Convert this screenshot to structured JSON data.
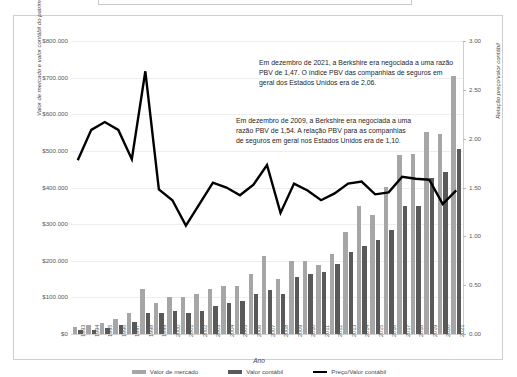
{
  "chart_data": {
    "type": "bar",
    "title": "",
    "xlabel": "Ano",
    "ylabel": "Valor de mercado e valor contábil do patrimônio (milhares de US$)",
    "ylabel_right": "Relação preço/valor contábil",
    "categories": [
      "1993",
      "1994",
      "1995",
      "1996",
      "1997",
      "1998",
      "1999",
      "2000",
      "2001",
      "2002",
      "2003",
      "2004",
      "2005",
      "2006",
      "2007",
      "2008",
      "2009",
      "2010",
      "2011",
      "2012",
      "2013",
      "2014",
      "2015",
      "2016",
      "2017",
      "2018",
      "2019",
      "2020",
      "2021"
    ],
    "ylim": [
      0,
      800000
    ],
    "ylim_right": [
      0,
      3.0
    ],
    "yticks": [
      "$0",
      "$100.000",
      "$200.000",
      "$300.000",
      "$400.000",
      "$500.000",
      "$600.000",
      "$700.000",
      "$800.000"
    ],
    "yticks_right": [
      "0.00",
      "0.50",
      "1.00",
      "1.50",
      "2.00",
      "2.50",
      "3.00"
    ],
    "grid": true,
    "legend_position": "bottom",
    "series": [
      {
        "name": "Valor de mercado",
        "type": "bar",
        "color": "#a6a6a6",
        "axis": "left",
        "values": [
          19800,
          23300,
          29600,
          42200,
          57600,
          122200,
          85600,
          101400,
          102200,
          109700,
          122100,
          130600,
          131200,
          163200,
          214000,
          149500,
          198000,
          200400,
          187600,
          219000,
          277500,
          350300,
          325400,
          401800,
          489100,
          492000,
          552500,
          545000,
          703800
        ]
      },
      {
        "name": "Valor contábil",
        "type": "bar",
        "color": "#595959",
        "axis": "left",
        "values": [
          10200,
          11900,
          17200,
          23400,
          31500,
          57400,
          57800,
          61700,
          57900,
          64000,
          77600,
          85900,
          91500,
          108400,
          120700,
          109300,
          156800,
          164900,
          168900,
          191600,
          224500,
          240200,
          255600,
          283000,
          348300,
          348700,
          424800,
          443200,
          506200
        ]
      },
      {
        "name": "Preço/Valor contábil",
        "type": "line",
        "color": "#000000",
        "axis": "right",
        "values": [
          1.78,
          2.09,
          2.17,
          2.09,
          1.79,
          2.69,
          1.48,
          1.37,
          1.11,
          1.33,
          1.55,
          1.5,
          1.42,
          1.53,
          1.73,
          1.24,
          1.54,
          1.47,
          1.37,
          1.44,
          1.54,
          1.56,
          1.43,
          1.45,
          1.61,
          1.59,
          1.58,
          1.33,
          1.47
        ]
      }
    ]
  },
  "annotations": {
    "a2021": "Em dezembro de 2021, a Berkshire era negociada a uma razão PBV de 1,47. O índice PBV das companhias de seguros em geral dos Estados Unidos era de 2,06.",
    "a2009": "Em dezembro de 2009, a Berkshire era negociada a uma razão PBV de 1,54. A relação PBV para as companhias de seguros em geral nos Estados Unidos era de 1,10."
  },
  "legend": {
    "items": [
      {
        "label": "Valor de mercado",
        "color": "#a6a6a6"
      },
      {
        "label": "Valor contábil",
        "color": "#595959"
      },
      {
        "label": "Preço/Valor contábil",
        "color": "#000000"
      }
    ]
  }
}
